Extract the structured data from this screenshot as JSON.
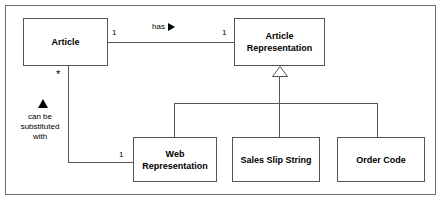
{
  "diagram": {
    "type": "uml-class-diagram",
    "classes": [
      {
        "id": "article",
        "name": "Article",
        "lines": [
          "Article"
        ]
      },
      {
        "id": "article-representation",
        "name": "Article Representation",
        "lines": [
          "Article",
          "Representation"
        ]
      },
      {
        "id": "web-representation",
        "name": "Web Representation",
        "lines": [
          "Web",
          "Representation"
        ]
      },
      {
        "id": "sales-slip-string",
        "name": "Sales Slip String",
        "lines": [
          "Sales Slip String"
        ]
      },
      {
        "id": "order-code",
        "name": "Order Code",
        "lines": [
          "Order Code"
        ]
      }
    ],
    "associations": [
      {
        "id": "has",
        "label": "has",
        "direction_marker": "filled-right-triangle",
        "source": "article",
        "target": "article-representation",
        "source_multiplicity": "1",
        "target_multiplicity": "1"
      },
      {
        "id": "can-be-substituted-with",
        "label_lines": [
          "can be",
          "substituted",
          "with"
        ],
        "direction_marker": "filled-up-triangle",
        "source": "article",
        "target": "web-representation",
        "source_multiplicity": "*",
        "target_multiplicity": "1"
      }
    ],
    "generalization": {
      "parent": "article-representation",
      "marker": "hollow-triangle",
      "children": [
        "web-representation",
        "sales-slip-string",
        "order-code"
      ]
    },
    "colors": {
      "box_border": "#555555",
      "frame_border": "#6e6e6e",
      "line": "#555555",
      "background": "#ffffff",
      "text": "#000000"
    }
  }
}
